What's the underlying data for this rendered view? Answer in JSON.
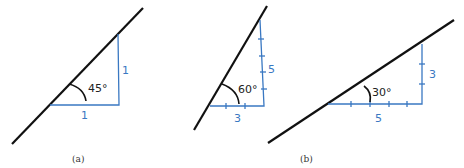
{
  "figures": [
    {
      "id": "a",
      "angle_label": "45°",
      "horizontal_label": "1",
      "vertical_label": "1",
      "caption": "(a)"
    },
    {
      "id": "b-left",
      "angle_label": "60°",
      "horizontal_label": "3",
      "vertical_label": "5",
      "caption": ""
    },
    {
      "id": "b-right",
      "angle_label": "30°",
      "horizontal_label": "5",
      "vertical_label": "3",
      "caption": "(b)"
    }
  ],
  "colors": {
    "slope_line": "#111111",
    "construction_line": "#3a78c2"
  }
}
